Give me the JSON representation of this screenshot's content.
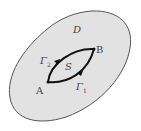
{
  "diagram": {
    "region_label": "D",
    "surface_label": "S",
    "point_a": "A",
    "point_b": "B",
    "curve_1": "Γ",
    "curve_1_sub": "1",
    "curve_2": "Γ",
    "curve_2_sub": "2",
    "colors": {
      "region_fill": "#e2e2e2",
      "region_stroke": "#555555",
      "curve_stroke": "#111111",
      "label": "#444444"
    }
  }
}
